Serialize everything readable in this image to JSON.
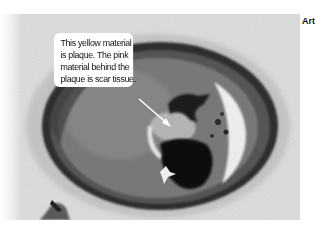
{
  "figure": {
    "callout": {
      "lines": [
        "This yellow material",
        "is plaque. The pink",
        "material behind the",
        "plaque is scar tissue."
      ]
    },
    "side_label": "Art"
  },
  "colors": {
    "background": "#ffffff",
    "callout_bg": "#ffffff",
    "text": "#111111",
    "arrow": "#ffffff",
    "tissue_outer": "#d4d4d4",
    "vessel_wall_dark": "#3a3a3a",
    "vessel_inner": "#7a7a7a",
    "lumen_crescent": "#e8e8e8",
    "clot_dark": "#101010"
  }
}
